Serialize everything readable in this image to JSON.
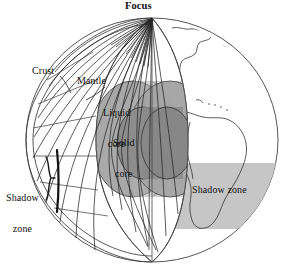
{
  "diagram": {
    "labels": {
      "focus": "Focus",
      "crust": "Crust",
      "mantle": "Mantle",
      "liquid_core_line1": "Liquid",
      "liquid_core_line2": "core",
      "solid_core_line1": "Solid",
      "solid_core_line2": "core",
      "shadow_zone_left_line1": "Shadow",
      "shadow_zone_left_line2": "zone",
      "shadow_zone_right": "Shadow zone"
    },
    "colors": {
      "background": "#ffffff",
      "outline": "#3b3b3b",
      "mantle_fill": "#ffffff",
      "liquid_core_fill": "#a9a9a9",
      "solid_core_fill": "#8d8d8d",
      "cut_face_fill": "#b6b6b6",
      "shadow_band_fill": "#c6c6c6",
      "ray_stroke": "#2b2b2b",
      "text": "#111111"
    }
  }
}
